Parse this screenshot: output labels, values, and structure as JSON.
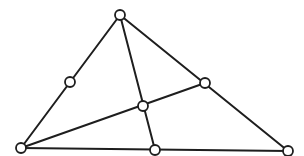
{
  "diagram": {
    "type": "triangle-cevians",
    "colors": {
      "line": "#1e1e1e",
      "node_fill": "#ffffff",
      "background": "#ffffff"
    },
    "node_radius": 5,
    "nodes": [
      {
        "id": "apex",
        "x": 120,
        "y": 15
      },
      {
        "id": "bottom-left",
        "x": 21,
        "y": 148
      },
      {
        "id": "bottom-right",
        "x": 288,
        "y": 151
      },
      {
        "id": "bottom-mid",
        "x": 155,
        "y": 150
      },
      {
        "id": "left-mid",
        "x": 70,
        "y": 82
      },
      {
        "id": "right-mid",
        "x": 205,
        "y": 83
      },
      {
        "id": "center",
        "x": 143,
        "y": 106
      }
    ],
    "edges": [
      {
        "from": "apex",
        "to": "bottom-left"
      },
      {
        "from": "apex",
        "to": "bottom-right"
      },
      {
        "from": "bottom-left",
        "to": "bottom-right"
      },
      {
        "from": "apex",
        "to": "bottom-mid"
      },
      {
        "from": "bottom-left",
        "to": "right-mid"
      }
    ]
  }
}
